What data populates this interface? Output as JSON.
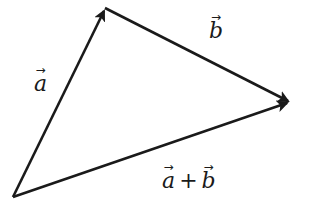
{
  "diagram": {
    "type": "vector-addition-triangle",
    "stroke_color": "#1a1a1a",
    "points": {
      "origin": [
        13,
        197
      ],
      "apex": [
        105,
        8
      ],
      "tip": [
        290,
        102
      ]
    },
    "vectors": [
      {
        "id": "a",
        "from": "origin",
        "to": "apex",
        "label": "a"
      },
      {
        "id": "b",
        "from": "apex",
        "to": "tip",
        "label": "b"
      },
      {
        "id": "sum",
        "from": "origin",
        "to": "tip",
        "label": "a + b"
      }
    ],
    "labels": {
      "a": {
        "symbol": "a",
        "arrow": "→"
      },
      "b": {
        "symbol": "b",
        "arrow": "→"
      },
      "sum": {
        "left": "a",
        "op": "+",
        "right": "b",
        "arrow": "→"
      }
    }
  }
}
